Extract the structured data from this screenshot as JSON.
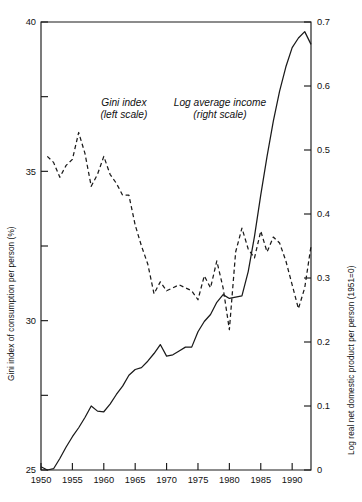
{
  "figure": {
    "background": "#ffffff",
    "line_color": "#1a1a1a"
  },
  "chart_data": {
    "type": "line",
    "title": "",
    "subtitle": "",
    "xlabel": "",
    "ylabel": "Gini index of consumption per person (%)",
    "y2label": "Log real net domestic product per person (1951=0)",
    "xlim": [
      1950,
      1993
    ],
    "ylim": [
      25,
      40
    ],
    "y2lim": [
      0,
      0.7
    ],
    "grid": false,
    "legend": "in-plot annotations",
    "xticks": [
      1950,
      1955,
      1960,
      1965,
      1970,
      1975,
      1980,
      1985,
      1990
    ],
    "xticklabels": [
      "1950",
      "1955",
      "1960",
      "1965",
      "1970",
      "1975",
      "1980",
      "1985",
      "1990"
    ],
    "yticks": [
      25,
      27.5,
      30,
      32.5,
      35,
      37.5,
      40
    ],
    "yticklabels": [
      "25",
      "",
      "30",
      "",
      "35",
      "",
      "40"
    ],
    "y2ticks": [
      0,
      0.1,
      0.2,
      0.3,
      0.4,
      0.5,
      0.6,
      0.7
    ],
    "y2ticklabels": [
      "0",
      "0.1",
      "0.2",
      "0.3",
      "0.4",
      "0.5",
      "0.6",
      "0.7"
    ],
    "annotations": [
      {
        "name": "gini-annotation",
        "line1": "Gini index",
        "line2": "(left scale)",
        "x": 1963.2,
        "y": 37.2
      },
      {
        "name": "income-annotation",
        "line1": "Log average income",
        "line2": "(right scale)",
        "x": 1978.5,
        "y": 37.2
      }
    ],
    "series": [
      {
        "name": "Gini index",
        "label": "Gini index (left scale)",
        "axis": "left",
        "style": "dashed",
        "units": "percent",
        "x": [
          1951,
          1952,
          1953,
          1954,
          1955,
          1956,
          1957,
          1958,
          1959,
          1960,
          1961,
          1962,
          1963,
          1964,
          1965,
          1966,
          1967,
          1968,
          1969,
          1970,
          1971,
          1972,
          1973,
          1974,
          1975,
          1976,
          1977,
          1978,
          1979,
          1980,
          1981,
          1982,
          1983,
          1984,
          1985,
          1986,
          1987,
          1988,
          1989,
          1990,
          1991,
          1992,
          1993
        ],
        "y": [
          35.5,
          35.3,
          34.8,
          35.2,
          35.4,
          36.3,
          35.6,
          34.5,
          34.9,
          35.5,
          34.9,
          34.6,
          34.2,
          34.2,
          33.2,
          32.5,
          31.9,
          30.9,
          31.3,
          31.0,
          31.1,
          31.2,
          31.1,
          31.0,
          30.7,
          31.5,
          31.1,
          32.0,
          31.1,
          29.7,
          32.3,
          33.1,
          32.4,
          32.1,
          33.0,
          32.3,
          32.8,
          32.6,
          32.0,
          31.2,
          30.4,
          31.1,
          32.5
        ]
      },
      {
        "name": "Log average income",
        "label": "Log average income (right scale)",
        "axis": "right",
        "style": "solid",
        "units": "log index (1951=0)",
        "x": [
          1950,
          1951,
          1952,
          1953,
          1954,
          1955,
          1956,
          1957,
          1958,
          1959,
          1960,
          1961,
          1962,
          1963,
          1964,
          1965,
          1966,
          1967,
          1968,
          1969,
          1970,
          1971,
          1972,
          1973,
          1974,
          1975,
          1976,
          1977,
          1978,
          1979,
          1980,
          1981,
          1982,
          1983,
          1984,
          1985,
          1986,
          1987,
          1988,
          1989,
          1990,
          1991,
          1992,
          1993
        ],
        "y": [
          0.005,
          0.0,
          0.002,
          0.018,
          0.036,
          0.052,
          0.066,
          0.082,
          0.1,
          0.092,
          0.091,
          0.103,
          0.118,
          0.131,
          0.148,
          0.157,
          0.16,
          0.17,
          0.182,
          0.196,
          0.178,
          0.18,
          0.186,
          0.192,
          0.192,
          0.216,
          0.232,
          0.243,
          0.262,
          0.274,
          0.268,
          0.27,
          0.272,
          0.31,
          0.365,
          0.43,
          0.49,
          0.545,
          0.592,
          0.63,
          0.66,
          0.675,
          0.685,
          0.665
        ]
      }
    ]
  }
}
